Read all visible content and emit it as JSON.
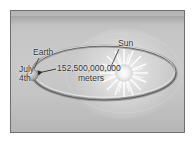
{
  "figure": {
    "kind": "astronomy-diagram",
    "background_color": "#c6c6c6",
    "border_color": "#6e6e6e",
    "page_color": "#ffffff",
    "ink_color": "#2b2b2b"
  },
  "labels": {
    "sun": "Sun",
    "earth": "Earth",
    "date_line1": "July",
    "date_line2": "4th",
    "distance_value": "152,500,000,000",
    "distance_units": "meters"
  },
  "objects": {
    "sun_name": "sun-starburst",
    "earth_name": "earth-body",
    "orbit_name": "orbit-ellipse"
  }
}
